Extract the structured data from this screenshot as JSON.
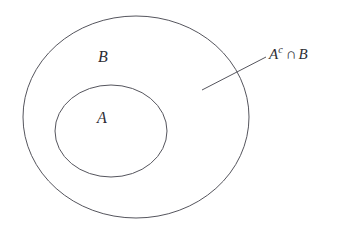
{
  "figure": {
    "type": "venn-diagram",
    "background_color": "#ffffff",
    "stroke_color": "#55555d",
    "text_color": "#2d2d33",
    "width": 353,
    "height": 230
  },
  "regions": {
    "outer_set": {
      "label": "B",
      "shape": "ellipse",
      "cx": 136,
      "cy": 117,
      "rx": 113,
      "ry": 101
    },
    "inner_set": {
      "label": "A",
      "shape": "ellipse",
      "cx": 111,
      "cy": 131,
      "rx": 56,
      "ry": 46
    }
  },
  "annotation": {
    "base": "A",
    "superscript": "c",
    "operator": "∩",
    "operand": "B",
    "full_text": "Aᶜ ∩ B",
    "leader_line": {
      "x1": 202,
      "y1": 90,
      "x2": 266,
      "y2": 57
    }
  }
}
